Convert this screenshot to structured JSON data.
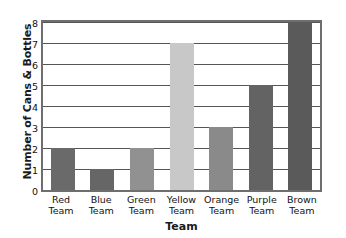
{
  "chart_data": {
    "type": "bar",
    "title": "",
    "subtitle": "",
    "xlabel": "Team",
    "ylabel": "Number of Cans & Bottles",
    "categories": [
      "Red Team",
      "Blue Team",
      "Green Team",
      "Yellow Team",
      "Orange Team",
      "Purple Team",
      "Brown Team"
    ],
    "category_lines": [
      {
        "line1": "Red",
        "line2": "Team"
      },
      {
        "line1": "Blue",
        "line2": "Team"
      },
      {
        "line1": "Green",
        "line2": "Team"
      },
      {
        "line1": "Yellow",
        "line2": "Team"
      },
      {
        "line1": "Orange",
        "line2": "Team"
      },
      {
        "line1": "Purple",
        "line2": "Team"
      },
      {
        "line1": "Brown",
        "line2": "Team"
      }
    ],
    "values": [
      2,
      1,
      2,
      7,
      3,
      5,
      8
    ],
    "bar_colors": [
      "#6a6a6a",
      "#666666",
      "#919191",
      "#c8c8c8",
      "#8a8a8a",
      "#636363",
      "#5a5a5a"
    ],
    "ylim": [
      0,
      8
    ],
    "ytick_labels": [
      "0",
      "1",
      "2",
      "3",
      "4",
      "5",
      "6",
      "7",
      "8"
    ],
    "ytick_values": [
      0,
      1,
      2,
      3,
      4,
      5,
      6,
      7,
      8
    ],
    "grid": true,
    "grid_axis": "y",
    "grid_color": "#555555",
    "legend": false,
    "legend_position": "none",
    "frame_color": "#6e6e6e",
    "background_color": "#ffffff"
  }
}
